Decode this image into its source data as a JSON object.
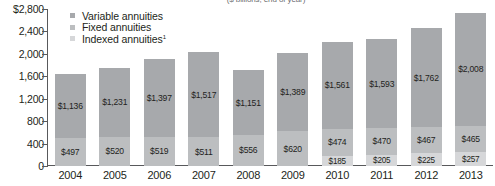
{
  "chart_data": {
    "type": "bar",
    "stacked": true,
    "title": "",
    "subtitle": "($ billions, end of year)",
    "xlabel": "",
    "ylabel": "",
    "categories": [
      "2004",
      "2005",
      "2006",
      "2007",
      "2008",
      "2009",
      "2010",
      "2011",
      "2012",
      "2013"
    ],
    "series": [
      {
        "name": "Variable annuities",
        "values": [
          1136,
          1231,
          1397,
          1517,
          1151,
          1389,
          1561,
          1593,
          1762,
          2008
        ],
        "labels": [
          "$1,136",
          "$1,231",
          "$1,397",
          "$1,517",
          "$1,151",
          "$1,389",
          "$1,561",
          "$1,593",
          "$1,762",
          "$2,008"
        ],
        "color": "#a7a9ac"
      },
      {
        "name": "Fixed annuities",
        "values": [
          497,
          520,
          519,
          511,
          556,
          620,
          474,
          470,
          467,
          465
        ],
        "labels": [
          "$497",
          "$520",
          "$519",
          "$511",
          "$556",
          "$620",
          "$474",
          "$470",
          "$467",
          "$465"
        ],
        "color": "#bcbec0"
      },
      {
        "name": "Indexed annuities",
        "values": [
          0,
          0,
          0,
          0,
          0,
          0,
          185,
          205,
          225,
          257
        ],
        "labels": [
          "",
          "",
          "",
          "",
          "",
          "",
          "$185",
          "$205",
          "$225",
          "$257"
        ],
        "color": "#d6d7d9"
      }
    ],
    "ylim": [
      0,
      2800
    ],
    "yticks": [
      0,
      400,
      800,
      1200,
      1600,
      2000,
      2400,
      2800
    ],
    "ytick_labels": [
      "0",
      "400",
      "800",
      "1,200",
      "1,600",
      "2,000",
      "2,400",
      "$2,800"
    ],
    "grid": false,
    "legend_position": "top-left",
    "legend": [
      {
        "label": "Variable annuities",
        "swatch": "#a7a9ac"
      },
      {
        "label": "Fixed annuities",
        "swatch": "#bcbec0"
      },
      {
        "label": "Indexed annuities",
        "superscript": "1",
        "swatch": "#d6d7d9"
      }
    ]
  }
}
